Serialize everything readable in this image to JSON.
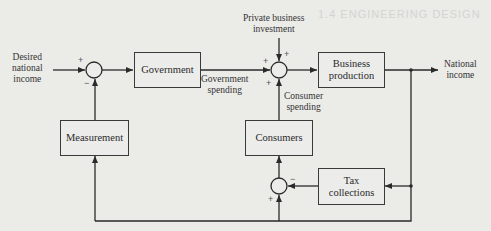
{
  "background_text": {
    "heading": "1.4 ENGINEERING DESIGN"
  },
  "diagram": {
    "type": "feedback control block diagram",
    "inputs": {
      "desired_national_income": "Desired\nnational\nincome",
      "private_business_investment": "Private business\ninvestment"
    },
    "output": {
      "national_income": "National\nincome"
    },
    "blocks": {
      "government": "Government",
      "business_production": "Business\nproduction",
      "measurement": "Measurement",
      "consumers": "Consumers",
      "tax_collections": "Tax\ncollections"
    },
    "signal_labels": {
      "government_spending": "Government\nspending",
      "consumer_spending": "Consumer\nspending"
    },
    "summing_junctions": [
      {
        "id": "sum1",
        "signs": {
          "left": "+",
          "bottom": "−"
        }
      },
      {
        "id": "sum2",
        "signs": {
          "left": "+",
          "top": "+",
          "bottom": "+"
        }
      },
      {
        "id": "sum3",
        "signs": {
          "right": "−",
          "bottom": "+"
        }
      }
    ],
    "colors": {
      "line": "#2a2a2a",
      "paper": "#ebebe8"
    }
  }
}
